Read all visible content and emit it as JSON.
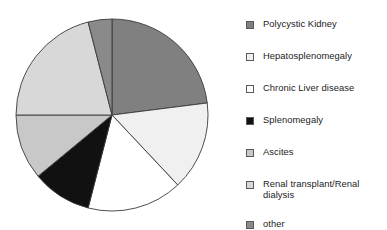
{
  "chart_data": {
    "type": "pie",
    "title": "",
    "subtitle": "",
    "xlabel": "",
    "ylabel": "",
    "legend_position": "right",
    "grid": false,
    "start_angle_deg": 0,
    "direction": "clockwise",
    "categories": [
      "Polycystic Kidney",
      "Hepatosplenomegaly",
      "Chronic Liver disease",
      "Splenomegaly",
      "Ascites",
      "Renal transplant/Renal dialysis",
      "other"
    ],
    "values": [
      23,
      15,
      16,
      10,
      11,
      21,
      4
    ],
    "value_unit": "%",
    "colors": [
      "#808080",
      "#F0F0F0",
      "#FFFFFF",
      "#111111",
      "#C8C8C8",
      "#D8D8D8",
      "#8A8A8A"
    ],
    "slice_border_color": "#3a3a3a"
  },
  "legend": {
    "items": [
      {
        "label": "Polycystic Kidney",
        "color": "#808080"
      },
      {
        "label": "Hepatosplenomegaly",
        "color": "#F0F0F0"
      },
      {
        "label": "Chronic Liver disease",
        "color": "#FFFFFF"
      },
      {
        "label": "Splenomegaly",
        "color": "#111111"
      },
      {
        "label": "Ascites",
        "color": "#C8C8C8"
      },
      {
        "label": "Renal transplant/Renal\ndialysis",
        "color": "#D8D8D8"
      },
      {
        "label": "other",
        "color": "#8A8A8A"
      }
    ]
  }
}
